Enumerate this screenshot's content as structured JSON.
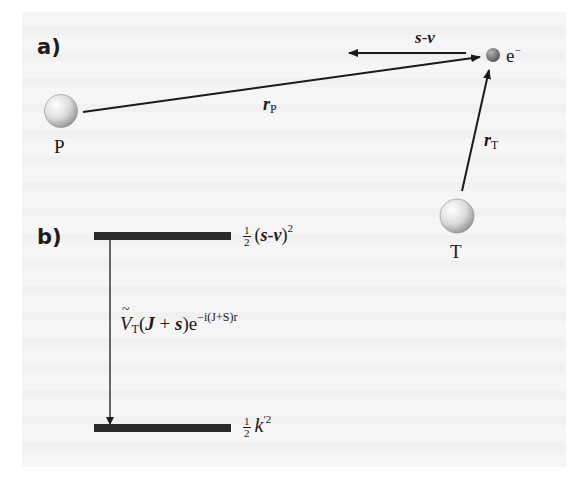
{
  "figure": {
    "panel_a": {
      "label": "a)",
      "particles": [
        {
          "id": "P",
          "label": "P",
          "kind": "projectile-nucleus"
        },
        {
          "id": "T",
          "label": "T",
          "kind": "target-nucleus"
        },
        {
          "id": "e",
          "label": "e",
          "charge_sup": "−",
          "kind": "electron"
        }
      ],
      "vectors": [
        {
          "id": "rP",
          "symbol": "r",
          "subscript": "P",
          "from": "P",
          "to": "e"
        },
        {
          "id": "rT",
          "symbol": "r",
          "subscript": "T",
          "from": "T",
          "to": "e"
        },
        {
          "id": "s-v",
          "symbol_left": "s",
          "dash": "-",
          "symbol_right": "v",
          "direction": "left",
          "origin": "e"
        }
      ]
    },
    "panel_b": {
      "label": "b)",
      "upper_level": {
        "frac_num": "1",
        "frac_den": "2",
        "expr_open": "(",
        "s": "s",
        "dash": "-",
        "v": "v",
        "expr_close": ")",
        "power": "2"
      },
      "transition": {
        "V": "V",
        "V_sub": "T",
        "arg_open": "(",
        "J": "J",
        "plus": " + ",
        "s": "s",
        "arg_close": ")",
        "exp_base": "e",
        "exp_power": "−i(J+S)r"
      },
      "lower_level": {
        "frac_num": "1",
        "frac_den": "2",
        "k": "k",
        "prime": "′",
        "power": "2"
      }
    },
    "colors": {
      "ink": "#1a1a1a",
      "level_bar": "#2a2a2a",
      "sphere_light": "#ffffff",
      "sphere_dark": "#9a9a9a",
      "electron_dark": "#555555",
      "background": "#f6f6f6"
    }
  }
}
